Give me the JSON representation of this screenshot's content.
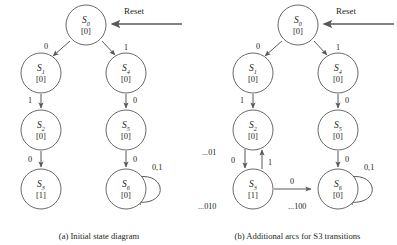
{
  "figure": {
    "panels": [
      {
        "id": "a",
        "caption": "(a) Initial state diagram",
        "reset_label": "Reset",
        "nodes": [
          {
            "id": "S0",
            "name": "S",
            "index": "0",
            "output": "[0]",
            "cx": 86,
            "cy": 25
          },
          {
            "id": "S1",
            "name": "S",
            "index": "1",
            "output": "[0]",
            "cx": 41,
            "cy": 73
          },
          {
            "id": "S4",
            "name": "S",
            "index": "4",
            "output": "[0]",
            "cx": 126,
            "cy": 73
          },
          {
            "id": "S2",
            "name": "S",
            "index": "2",
            "output": "[0]",
            "cx": 41,
            "cy": 130
          },
          {
            "id": "S5",
            "name": "S",
            "index": "5",
            "output": "[0]",
            "cx": 126,
            "cy": 130
          },
          {
            "id": "S3",
            "name": "S",
            "index": "3",
            "output": "[1]",
            "cx": 41,
            "cy": 189
          },
          {
            "id": "S6",
            "name": "S",
            "index": "6",
            "output": "[0]",
            "cx": 126,
            "cy": 189
          }
        ],
        "arcs": [
          {
            "from": "S0",
            "to": "S1",
            "label": "0"
          },
          {
            "from": "S0",
            "to": "S4",
            "label": "1"
          },
          {
            "from": "S1",
            "to": "S2",
            "label": "1"
          },
          {
            "from": "S4",
            "to": "S5",
            "label": "0"
          },
          {
            "from": "S2",
            "to": "S3",
            "label": "0"
          },
          {
            "from": "S5",
            "to": "S6",
            "label": "0"
          },
          {
            "from": "S6",
            "to": "S6",
            "label": "0,1"
          }
        ]
      },
      {
        "id": "b",
        "caption": "(b) Additional arcs for S3 transitions",
        "reset_label": "Reset",
        "nodes": [
          {
            "id": "S0",
            "name": "S",
            "index": "0",
            "output": "[0]",
            "cx": 100,
            "cy": 25
          },
          {
            "id": "S1",
            "name": "S",
            "index": "1",
            "output": "[0]",
            "cx": 55,
            "cy": 73
          },
          {
            "id": "S4",
            "name": "S",
            "index": "4",
            "output": "[0]",
            "cx": 140,
            "cy": 73
          },
          {
            "id": "S2",
            "name": "S",
            "index": "2",
            "output": "[0]",
            "cx": 55,
            "cy": 130
          },
          {
            "id": "S5",
            "name": "S",
            "index": "5",
            "output": "[0]",
            "cx": 140,
            "cy": 130
          },
          {
            "id": "S3",
            "name": "S",
            "index": "3",
            "output": "[1]",
            "cx": 55,
            "cy": 189
          },
          {
            "id": "S6",
            "name": "S",
            "index": "6",
            "output": "[0]",
            "cx": 140,
            "cy": 189
          }
        ],
        "arcs": [
          {
            "from": "S0",
            "to": "S1",
            "label": "0"
          },
          {
            "from": "S0",
            "to": "S4",
            "label": "1"
          },
          {
            "from": "S1",
            "to": "S2",
            "label": "1"
          },
          {
            "from": "S4",
            "to": "S5",
            "label": "0"
          },
          {
            "from": "S2",
            "to": "S3",
            "label": "0"
          },
          {
            "from": "S3",
            "to": "S2",
            "label": "1"
          },
          {
            "from": "S5",
            "to": "S6",
            "label": "0"
          },
          {
            "from": "S3",
            "to": "S6",
            "label": "0"
          },
          {
            "from": "S6",
            "to": "S6",
            "label": "0,1"
          }
        ],
        "sequence_labels": [
          {
            "id": "seq-s2",
            "text": "...01"
          },
          {
            "id": "seq-s3",
            "text": "...010"
          },
          {
            "id": "seq-s6",
            "text": "...100"
          }
        ]
      }
    ],
    "node_radius": 20,
    "colors": {
      "stroke": "#58595b",
      "text": "#231f20",
      "background": "#ffffff"
    }
  }
}
